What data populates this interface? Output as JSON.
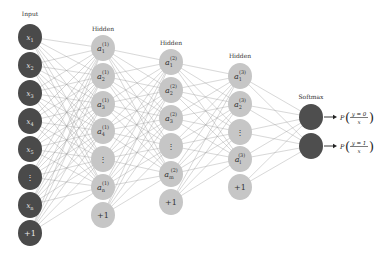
{
  "diagram": {
    "colors": {
      "input_node": "#4a4a4a",
      "hidden_node": "#c6c6c6",
      "softmax_node": "#4e4e4e",
      "edge": "#9a9a9a",
      "background": "#ffffff"
    },
    "layers": [
      {
        "id": "input",
        "label": "Input",
        "label_pos": [
          30,
          16
        ],
        "type": "input",
        "x": 30,
        "radius": 12,
        "nodes": [
          {
            "y": 37,
            "text": "x",
            "sub": "1"
          },
          {
            "y": 65,
            "text": "x",
            "sub": "2"
          },
          {
            "y": 93,
            "text": "x",
            "sub": "3"
          },
          {
            "y": 121,
            "text": "x",
            "sub": "4"
          },
          {
            "y": 149,
            "text": "x",
            "sub": "5"
          },
          {
            "y": 177,
            "text": "⋮",
            "sub": ""
          },
          {
            "y": 205,
            "text": "x",
            "sub": "n"
          },
          {
            "y": 233,
            "text": "+1",
            "sub": ""
          }
        ]
      },
      {
        "id": "hidden1",
        "label": "Hidden",
        "label_pos": [
          103,
          31
        ],
        "type": "hidden",
        "x": 103,
        "radius": 12,
        "nodes": [
          {
            "y": 48,
            "text": "a",
            "sub": "1",
            "sup": "(1)"
          },
          {
            "y": 76,
            "text": "a",
            "sub": "2",
            "sup": "(1)"
          },
          {
            "y": 104,
            "text": "a",
            "sub": "3",
            "sup": "(1)"
          },
          {
            "y": 131,
            "text": "a",
            "sub": "4",
            "sup": "(1)"
          },
          {
            "y": 159,
            "text": "⋮",
            "sub": "",
            "sup": ""
          },
          {
            "y": 187,
            "text": "a",
            "sub": "n",
            "sup": "(1)"
          },
          {
            "y": 215,
            "text": "+1",
            "sub": "",
            "sup": ""
          }
        ]
      },
      {
        "id": "hidden2",
        "label": "Hidden",
        "label_pos": [
          171,
          45
        ],
        "type": "hidden",
        "x": 171,
        "radius": 12,
        "nodes": [
          {
            "y": 62,
            "text": "a",
            "sub": "1",
            "sup": "(2)"
          },
          {
            "y": 90,
            "text": "a",
            "sub": "2",
            "sup": "(2)"
          },
          {
            "y": 118,
            "text": "a",
            "sub": "3",
            "sup": "(2)"
          },
          {
            "y": 146,
            "text": "⋮",
            "sub": "",
            "sup": ""
          },
          {
            "y": 174,
            "text": "a",
            "sub": "m",
            "sup": "(2)"
          },
          {
            "y": 202,
            "text": "+1",
            "sub": "",
            "sup": ""
          }
        ]
      },
      {
        "id": "hidden3",
        "label": "Hidden",
        "label_pos": [
          240,
          58
        ],
        "type": "hidden",
        "x": 240,
        "radius": 12,
        "nodes": [
          {
            "y": 76,
            "text": "a",
            "sub": "1",
            "sup": "(3)"
          },
          {
            "y": 104,
            "text": "a",
            "sub": "2",
            "sup": "(3)"
          },
          {
            "y": 132,
            "text": "⋮",
            "sub": "",
            "sup": ""
          },
          {
            "y": 159,
            "text": "a",
            "sub": "l",
            "sup": "(3)"
          },
          {
            "y": 187,
            "text": "+1",
            "sub": "",
            "sup": ""
          }
        ]
      },
      {
        "id": "softmax",
        "label": "Softmax",
        "label_pos": [
          311,
          99
        ],
        "type": "softmax",
        "x": 311,
        "radius": 12,
        "nodes": [
          {
            "y": 117,
            "text": "",
            "sub": ""
          },
          {
            "y": 146,
            "text": "",
            "sub": ""
          }
        ]
      }
    ],
    "outputs": [
      {
        "prefix": "P",
        "numerator": "y = 0",
        "denominator": "x",
        "y": 117
      },
      {
        "prefix": "P",
        "numerator": "y = 1",
        "denominator": "x",
        "y": 146
      }
    ]
  }
}
